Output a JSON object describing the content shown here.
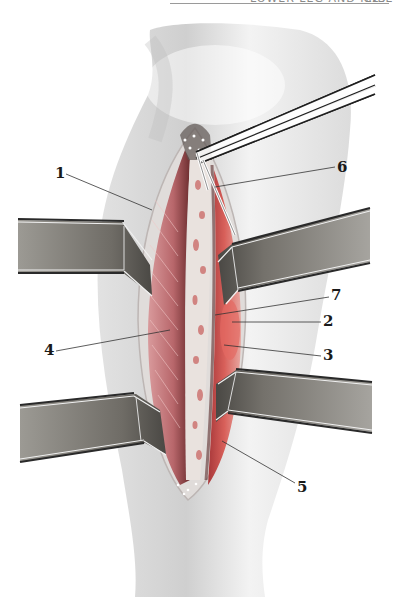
{
  "header": {
    "running_title": "LOWER LEG AND KNEE",
    "page_number": "229"
  },
  "figure": {
    "colors": {
      "skin": "#ececec",
      "skin_shadow": "#c9c9c9",
      "muscle": "#c96e72",
      "muscle_dark": "#8e3c3f",
      "tendon": "#e4dcd8",
      "retractor": "#7c7a74",
      "retractor_edge": "#2c2c2c"
    },
    "labels": [
      {
        "id": "1",
        "text": "1",
        "x": 55,
        "y": 166
      },
      {
        "id": "6",
        "text": "6",
        "x": 337,
        "y": 160
      },
      {
        "id": "7",
        "text": "7",
        "x": 331,
        "y": 288
      },
      {
        "id": "2",
        "text": "2",
        "x": 323,
        "y": 314
      },
      {
        "id": "4",
        "text": "4",
        "x": 44,
        "y": 346
      },
      {
        "id": "3",
        "text": "3",
        "x": 323,
        "y": 348
      },
      {
        "id": "5",
        "text": "5",
        "x": 297,
        "y": 483
      }
    ]
  }
}
